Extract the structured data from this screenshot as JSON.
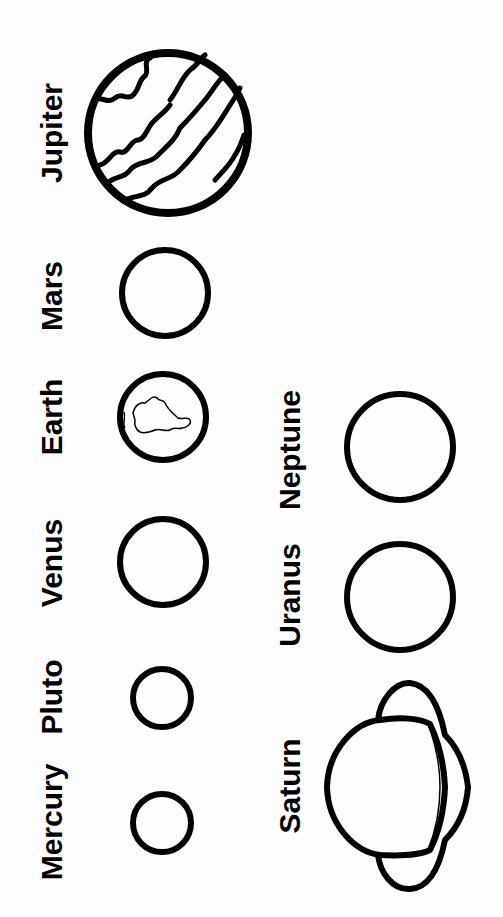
{
  "worksheet": {
    "orientation": "rotated 90deg counter-clockwise",
    "stroke_color": "#000000",
    "background_color": "#fdfdfd",
    "planets": [
      {
        "name": "Jupiter",
        "label_x": 52,
        "label_y": 133,
        "cx": 168,
        "cy": 133,
        "r": 80,
        "style": "banded"
      },
      {
        "name": "Mars",
        "label_x": 52,
        "label_y": 296,
        "cx": 165,
        "cy": 293,
        "r": 43,
        "style": "plain"
      },
      {
        "name": "Earth",
        "label_x": 52,
        "label_y": 417,
        "cx": 163,
        "cy": 417,
        "r": 43,
        "style": "continent"
      },
      {
        "name": "Venus",
        "label_x": 52,
        "label_y": 563,
        "cx": 163,
        "cy": 562,
        "r": 43,
        "style": "plain"
      },
      {
        "name": "Pluto",
        "label_x": 52,
        "label_y": 697,
        "cx": 162,
        "cy": 698,
        "r": 29,
        "style": "plain"
      },
      {
        "name": "Mercury",
        "label_x": 52,
        "label_y": 822,
        "cx": 162,
        "cy": 823,
        "r": 29,
        "style": "plain"
      },
      {
        "name": "Neptune",
        "label_x": 290,
        "label_y": 450,
        "cx": 400,
        "cy": 447,
        "r": 53,
        "style": "plain"
      },
      {
        "name": "Uranus",
        "label_x": 290,
        "label_y": 595,
        "cx": 400,
        "cy": 597,
        "r": 53,
        "style": "plain"
      },
      {
        "name": "Saturn",
        "label_x": 290,
        "label_y": 786,
        "cx": 395,
        "cy": 787,
        "r": 62,
        "style": "ringed"
      }
    ]
  }
}
